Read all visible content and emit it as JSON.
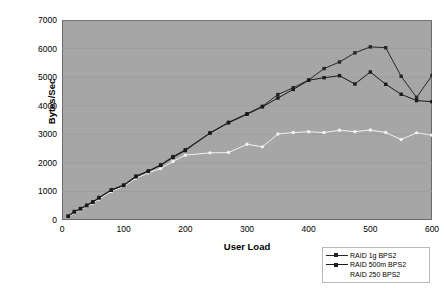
{
  "chart_data": {
    "type": "line",
    "title": "",
    "xlabel": "User Load",
    "ylabel": "Bytes/Sec",
    "xlim": [
      0,
      600
    ],
    "ylim": [
      0,
      7000
    ],
    "xticks": [
      0,
      100,
      200,
      300,
      400,
      500,
      600
    ],
    "yticks": [
      0,
      1000,
      2000,
      3000,
      4000,
      5000,
      6000,
      7000
    ],
    "grid": "horizontal",
    "legend_position": "bottom-right-outside",
    "plot_background": "#a6a6a6",
    "series": [
      {
        "name": "RAID 1g BPS2",
        "color": "#262626",
        "marker": "square",
        "x": [
          10,
          20,
          30,
          40,
          50,
          60,
          80,
          100,
          120,
          140,
          160,
          180,
          200,
          240,
          270,
          300,
          325,
          350,
          375,
          400,
          425,
          450,
          475,
          500,
          525,
          550,
          575,
          600
        ],
        "values": [
          140,
          300,
          400,
          520,
          640,
          790,
          1060,
          1230,
          1540,
          1720,
          1930,
          2220,
          2460,
          3050,
          3420,
          3720,
          3980,
          4390,
          4630,
          4900,
          5300,
          5530,
          5850,
          6060,
          6030,
          5030,
          4290,
          5060
        ]
      },
      {
        "name": "RAID 500m BPS2",
        "color": "#1a1a1a",
        "marker": "square",
        "x": [
          10,
          20,
          30,
          40,
          50,
          60,
          80,
          100,
          120,
          140,
          160,
          180,
          200,
          240,
          270,
          300,
          325,
          350,
          375,
          400,
          425,
          450,
          475,
          500,
          525,
          550,
          575,
          600
        ],
        "values": [
          120,
          280,
          390,
          500,
          620,
          770,
          1040,
          1200,
          1510,
          1700,
          1910,
          2190,
          2430,
          3040,
          3400,
          3700,
          3960,
          4270,
          4570,
          4890,
          4980,
          5050,
          4760,
          5180,
          4750,
          4400,
          4180,
          4140
        ]
      },
      {
        "name": "RAID 250 BPS2",
        "color": "#f2f2f2",
        "marker": "circle",
        "x": [
          10,
          20,
          30,
          40,
          50,
          60,
          80,
          100,
          120,
          140,
          160,
          180,
          200,
          240,
          270,
          300,
          325,
          350,
          375,
          400,
          425,
          450,
          475,
          500,
          525,
          550,
          575,
          600
        ],
        "values": [
          100,
          250,
          360,
          470,
          590,
          730,
          1000,
          1170,
          1460,
          1650,
          1800,
          2050,
          2270,
          2350,
          2360,
          2650,
          2560,
          3010,
          3060,
          3090,
          3060,
          3140,
          3090,
          3150,
          3060,
          2820,
          3050,
          2970
        ]
      }
    ]
  },
  "legend": {
    "items": [
      {
        "label": "RAID 1g BPS2"
      },
      {
        "label": "RAID 500m BPS2"
      },
      {
        "label": "RAID 250 BPS2"
      }
    ]
  }
}
